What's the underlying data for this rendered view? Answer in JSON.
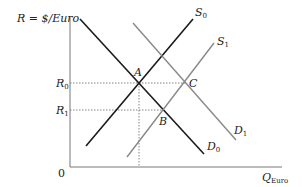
{
  "axes": {
    "y_label": "R = $/Euro",
    "x_label_main": "Q",
    "x_label_sub": "Euro",
    "origin": "0",
    "colors": {
      "axis": "#777777"
    }
  },
  "levels": [
    {
      "label_main": "R",
      "label_sub": "0",
      "y": 83
    },
    {
      "label_main": "R",
      "label_sub": "1",
      "y": 110
    }
  ],
  "curves": [
    {
      "name": "D",
      "sub": "0",
      "kind": "demand",
      "color": "#1a1a1a",
      "x1": 80,
      "y1": 19,
      "x2": 204,
      "y2": 154,
      "lx": 207,
      "ly": 150
    },
    {
      "name": "S",
      "sub": "0",
      "kind": "supply",
      "color": "#1a1a1a",
      "x1": 86,
      "y1": 146,
      "x2": 193,
      "y2": 19,
      "lx": 195,
      "ly": 16
    },
    {
      "name": "D",
      "sub": "1",
      "kind": "demand",
      "color": "#888888",
      "x1": 133,
      "y1": 23,
      "x2": 236,
      "y2": 140,
      "lx": 234,
      "ly": 134
    },
    {
      "name": "S",
      "sub": "1",
      "kind": "supply",
      "color": "#888888",
      "x1": 127,
      "y1": 157,
      "x2": 214,
      "y2": 43,
      "lx": 217,
      "ly": 45
    }
  ],
  "points": [
    {
      "label": "A",
      "x": 139,
      "y": 83,
      "lx": 134,
      "ly": 76
    },
    {
      "label": "B",
      "x": 163,
      "y": 110,
      "lx": 159,
      "ly": 125
    },
    {
      "label": "C",
      "x": 185,
      "y": 83,
      "lx": 189,
      "ly": 87
    }
  ]
}
